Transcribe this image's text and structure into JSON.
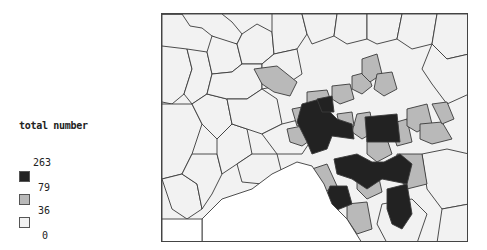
{
  "legend": {
    "title": "total number",
    "breaks": [
      "263",
      "79",
      "36",
      "0"
    ],
    "classes": [
      {
        "name": "high",
        "range": "79–263",
        "color": "#222222"
      },
      {
        "name": "medium",
        "range": "36–79",
        "color": "#b9b9b9"
      },
      {
        "name": "low",
        "range": "0–36",
        "color": "#f2f2f2"
      }
    ]
  },
  "map": {
    "type": "choropleth",
    "water_color": "#ffffff",
    "border_color": "#3a3a3a"
  }
}
